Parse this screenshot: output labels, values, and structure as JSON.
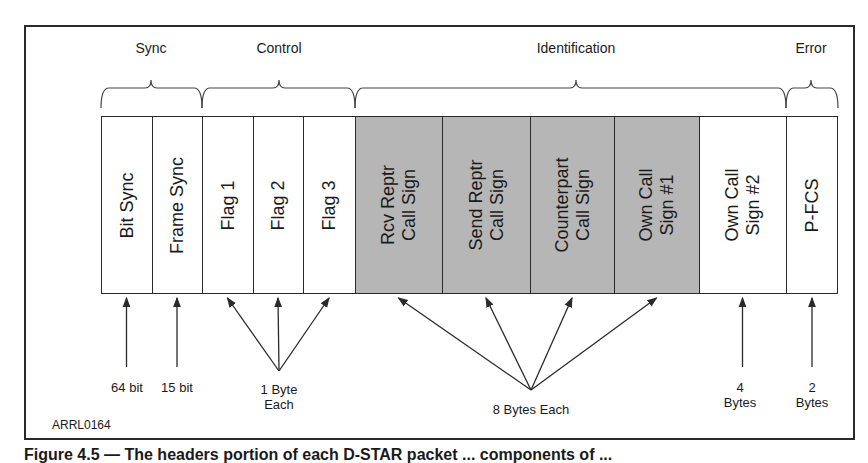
{
  "groups": [
    {
      "label": "Sync",
      "center_x": 151,
      "from_x": 101,
      "to_x": 202
    },
    {
      "label": "Control",
      "center_x": 279,
      "from_x": 202,
      "to_x": 355
    },
    {
      "label": "Identification",
      "center_x": 576,
      "from_x": 355,
      "to_x": 786
    },
    {
      "label": "Error",
      "center_x": 811,
      "from_x": 786,
      "to_x": 838
    }
  ],
  "fields": [
    {
      "label": "Bit Sync",
      "x": 101,
      "w": 51,
      "shaded": false
    },
    {
      "label": "Frame Sync",
      "x": 152,
      "w": 50,
      "shaded": false
    },
    {
      "label": "Flag 1",
      "x": 202,
      "w": 51,
      "shaded": false
    },
    {
      "label": "Flag 2",
      "x": 253,
      "w": 50,
      "shaded": false
    },
    {
      "label": "Flag 3",
      "x": 303,
      "w": 52,
      "shaded": false
    },
    {
      "label": "Rcv Reptr\nCall Sign",
      "x": 355,
      "w": 87,
      "shaded": true
    },
    {
      "label": "Send Reptr\nCall Sign",
      "x": 442,
      "w": 88,
      "shaded": true
    },
    {
      "label": "Counterpart\nCall Sign",
      "x": 530,
      "w": 84,
      "shaded": true
    },
    {
      "label": "Own Call\nSign #1",
      "x": 614,
      "w": 85,
      "shaded": true
    },
    {
      "label": "Own Call\nSign #2",
      "x": 699,
      "w": 87,
      "shaded": false
    },
    {
      "label": "P-FCS",
      "x": 786,
      "w": 52,
      "shaded": false
    }
  ],
  "sizes": [
    {
      "label": "64 bit",
      "x": 127,
      "y": 380
    },
    {
      "label": "15 bit",
      "x": 177,
      "y": 380
    },
    {
      "label": "1 Byte\nEach",
      "x": 279,
      "y": 382
    },
    {
      "label": "8 Bytes Each",
      "x": 531,
      "y": 402
    },
    {
      "label": "4\nBytes",
      "x": 740,
      "y": 380
    },
    {
      "label": "2\nBytes",
      "x": 812,
      "y": 380
    }
  ],
  "figure_id": "ARRL0164",
  "caption": "Figure 4.5 — The headers portion of each D-STAR packet ... components of ..."
}
